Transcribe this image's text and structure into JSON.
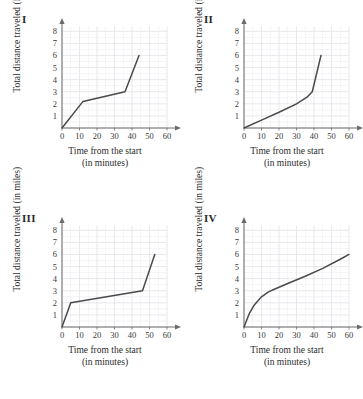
{
  "figure": {
    "panel_count": 4,
    "axis_label_x_line1": "Time from the start",
    "axis_label_x_line2": "(in minutes)",
    "axis_label_y": "Total distance traveled (in miles)",
    "curve_color": "#4a4a4a",
    "grid_color": "#e2e2e8",
    "axis_color": "#6b6b6b",
    "background_color": "#ffffff"
  },
  "chart_data": [
    {
      "type": "line",
      "title": "I",
      "xlabel": "Time from the start (in minutes)",
      "ylabel": "Total distance traveled (in miles)",
      "xlim": [
        0,
        64
      ],
      "ylim": [
        0,
        8.6
      ],
      "xticks": [
        0,
        10,
        20,
        30,
        40,
        50,
        60
      ],
      "yticks": [
        1,
        2,
        3,
        4,
        5,
        6,
        7,
        8
      ],
      "xtick_labels": [
        "0",
        "10",
        "20",
        "30",
        "40",
        "50",
        "60"
      ],
      "ytick_labels": [
        "1",
        "2",
        "3",
        "4",
        "5",
        "6",
        "7",
        "8"
      ],
      "grid": true,
      "legend": "none",
      "x": [
        0,
        12,
        36,
        44
      ],
      "y": [
        0,
        2.2,
        3.0,
        6.0
      ],
      "description": "Steep rise, then slow middle segment, then steep rise to 6 miles at 44 minutes"
    },
    {
      "type": "line",
      "title": "II",
      "xlabel": "Time from the start (in minutes)",
      "ylabel": "Total distance traveled (in miles)",
      "xlim": [
        0,
        64
      ],
      "ylim": [
        0,
        8.6
      ],
      "xticks": [
        0,
        10,
        20,
        30,
        40,
        50,
        60
      ],
      "yticks": [
        1,
        2,
        3,
        4,
        5,
        6,
        7,
        8
      ],
      "xtick_labels": [
        "0",
        "10",
        "20",
        "30",
        "40",
        "50",
        "60"
      ],
      "ytick_labels": [
        "1",
        "2",
        "3",
        "4",
        "5",
        "6",
        "7",
        "8"
      ],
      "grid": true,
      "legend": "none",
      "x": [
        0,
        10,
        20,
        30,
        36,
        39,
        41,
        44
      ],
      "y": [
        0,
        0.65,
        1.3,
        2.0,
        2.55,
        3.0,
        4.2,
        6.0
      ],
      "description": "Gradual steady rise that curves sharply upward near 40 minutes reaching 6 miles"
    },
    {
      "type": "line",
      "title": "III",
      "xlabel": "Time from the start (in minutes)",
      "ylabel": "Total distance traveled (in miles)",
      "xlim": [
        0,
        64
      ],
      "ylim": [
        0,
        8.6
      ],
      "xticks": [
        0,
        10,
        20,
        30,
        40,
        50,
        60
      ],
      "yticks": [
        1,
        2,
        3,
        4,
        5,
        6,
        7,
        8
      ],
      "xtick_labels": [
        "0",
        "10",
        "20",
        "30",
        "40",
        "50",
        "60"
      ],
      "ytick_labels": [
        "1",
        "2",
        "3",
        "4",
        "5",
        "6",
        "7",
        "8"
      ],
      "grid": true,
      "legend": "none",
      "x": [
        0,
        5,
        46,
        53
      ],
      "y": [
        0,
        2.0,
        3.0,
        6.0
      ],
      "description": "Very steep start to 2 miles, long slow middle to 3 miles, then steep finish to 6 miles"
    },
    {
      "type": "line",
      "title": "IV",
      "xlabel": "Time from the start (in minutes)",
      "ylabel": "Total distance traveled (in miles)",
      "xlim": [
        0,
        64
      ],
      "ylim": [
        0,
        8.6
      ],
      "xticks": [
        0,
        10,
        20,
        30,
        40,
        50,
        60
      ],
      "yticks": [
        1,
        2,
        3,
        4,
        5,
        6,
        7,
        8
      ],
      "xtick_labels": [
        "0",
        "10",
        "20",
        "30",
        "40",
        "50",
        "60"
      ],
      "ytick_labels": [
        "1",
        "2",
        "3",
        "4",
        "5",
        "6",
        "7",
        "8"
      ],
      "grid": true,
      "legend": "none",
      "x": [
        0,
        3,
        6,
        10,
        14,
        17,
        25,
        35,
        45,
        55,
        60
      ],
      "y": [
        0,
        1.1,
        1.85,
        2.5,
        2.9,
        3.1,
        3.6,
        4.2,
        4.85,
        5.6,
        6.0
      ],
      "description": "Concave increasing curve: fast early rise then steady gentler climb to 6 miles at 60 minutes"
    }
  ]
}
